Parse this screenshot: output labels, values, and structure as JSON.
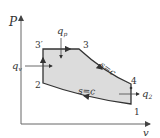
{
  "diagram": {
    "type": "P-v thermodynamic cycle diagram",
    "axes": {
      "y_label": "P",
      "x_label": "v"
    },
    "points": [
      {
        "id": "1",
        "label": "1"
      },
      {
        "id": "2",
        "label": "2"
      },
      {
        "id": "3",
        "label": "3"
      },
      {
        "id": "3p",
        "label": "3′"
      },
      {
        "id": "4",
        "label": "4"
      }
    ],
    "processes": [
      {
        "from": "1",
        "to": "2",
        "label": "s=c"
      },
      {
        "from": "2",
        "to": "3p",
        "label": ""
      },
      {
        "from": "3p",
        "to": "3",
        "label": ""
      },
      {
        "from": "3",
        "to": "4",
        "label": "s=c"
      },
      {
        "from": "4",
        "to": "1",
        "label": ""
      }
    ],
    "heat_flows": [
      {
        "label": "q",
        "sub": "v",
        "direction": "in",
        "location": "process 2-3'"
      },
      {
        "label": "q",
        "sub": "p",
        "direction": "in",
        "location": "process 3'-3"
      },
      {
        "label": "q",
        "sub": "2",
        "direction": "out",
        "location": "process 4-1"
      }
    ],
    "colors": {
      "fill": "#dcdcdc",
      "line": "#333333",
      "axis": "#666666"
    }
  }
}
